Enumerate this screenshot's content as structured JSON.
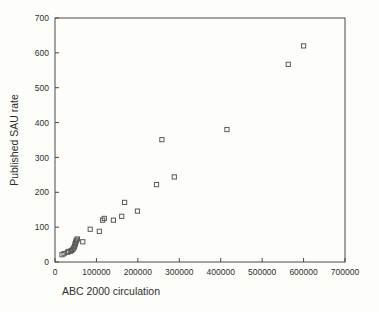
{
  "chart_data": {
    "type": "scatter",
    "title": "",
    "xlabel": "ABC 2000 circulation",
    "ylabel": "Published SAU rate",
    "xlim": [
      0,
      700000
    ],
    "ylim": [
      0,
      700
    ],
    "xticks": [
      0,
      100000,
      200000,
      300000,
      400000,
      500000,
      600000,
      700000
    ],
    "yticks": [
      0,
      100,
      200,
      300,
      400,
      500,
      600,
      700
    ],
    "xtick_labels": [
      "0",
      "100000",
      "200000",
      "300000",
      "400000",
      "500000",
      "600000",
      "700000"
    ],
    "ytick_labels": [
      "0",
      "100",
      "200",
      "300",
      "400",
      "500",
      "600",
      "700"
    ],
    "grid": false,
    "legend": null,
    "marker": "open-square",
    "points": [
      {
        "x": 17000,
        "y": 21
      },
      {
        "x": 22000,
        "y": 24
      },
      {
        "x": 30000,
        "y": 28
      },
      {
        "x": 33000,
        "y": 30
      },
      {
        "x": 37000,
        "y": 31
      },
      {
        "x": 40000,
        "y": 33
      },
      {
        "x": 43000,
        "y": 36
      },
      {
        "x": 45000,
        "y": 40
      },
      {
        "x": 47000,
        "y": 44
      },
      {
        "x": 48000,
        "y": 49
      },
      {
        "x": 49000,
        "y": 53
      },
      {
        "x": 50000,
        "y": 57
      },
      {
        "x": 51000,
        "y": 60
      },
      {
        "x": 52000,
        "y": 63
      },
      {
        "x": 54000,
        "y": 66
      },
      {
        "x": 67000,
        "y": 58
      },
      {
        "x": 85000,
        "y": 94
      },
      {
        "x": 107000,
        "y": 88
      },
      {
        "x": 115000,
        "y": 120
      },
      {
        "x": 119000,
        "y": 125
      },
      {
        "x": 141000,
        "y": 120
      },
      {
        "x": 161000,
        "y": 131
      },
      {
        "x": 168000,
        "y": 171
      },
      {
        "x": 199000,
        "y": 146
      },
      {
        "x": 245000,
        "y": 222
      },
      {
        "x": 258000,
        "y": 351
      },
      {
        "x": 288000,
        "y": 244
      },
      {
        "x": 415000,
        "y": 380
      },
      {
        "x": 563000,
        "y": 567
      },
      {
        "x": 600000,
        "y": 620
      }
    ]
  }
}
